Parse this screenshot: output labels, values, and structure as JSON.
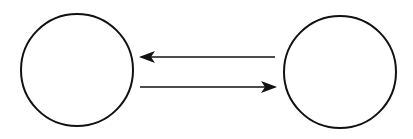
{
  "diagram": {
    "width": 413,
    "height": 139,
    "background": "#ffffff",
    "stroke_color": "#111111",
    "nodes": [
      {
        "id": "left-node",
        "cx": 77,
        "cy": 70,
        "r": 56,
        "label": ""
      },
      {
        "id": "right-node",
        "cx": 340,
        "cy": 72,
        "r": 56,
        "label": ""
      }
    ],
    "edges": [
      {
        "id": "arrow-right-to-left",
        "from": "right-node",
        "to": "left-node",
        "x1": 275,
        "y1": 57,
        "x2": 141,
        "y2": 57
      },
      {
        "id": "arrow-left-to-right",
        "from": "left-node",
        "to": "right-node",
        "x1": 140,
        "y1": 87,
        "x2": 275,
        "y2": 87
      }
    ]
  }
}
